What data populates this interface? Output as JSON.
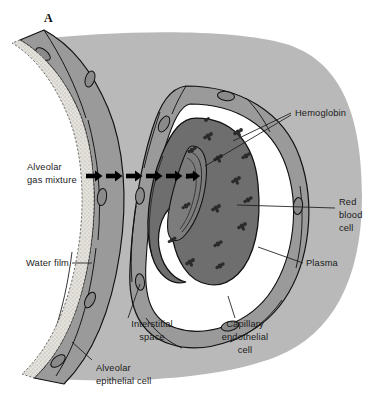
{
  "figure": {
    "panel_label": "A",
    "background_color": "#ffffff"
  },
  "palette": {
    "interstitial_gray": "#b9b9b9",
    "epithelium_gray": "#9a9a9a",
    "endothelium_gray": "#9a9a9a",
    "plasma_white": "#ffffff",
    "rbc_gray": "#6e6e6e",
    "rbc_inner_gray": "#7c7c7c",
    "hemoglobin_dark": "#2b2b2b",
    "water_film_light": "#e2e0da",
    "nucleus_gray": "#8a8a8a",
    "outline_black": "#111111",
    "arrow_black": "#000000"
  },
  "labels": {
    "hemoglobin": {
      "text": "Hemoglobin",
      "lines": [
        "Hemoglobin"
      ],
      "align": "left"
    },
    "alveolar_gas_mixture": {
      "text": "Alveolar gas mixture",
      "lines": [
        "Alveolar",
        "gas mixture"
      ],
      "align": "left"
    },
    "red_blood_cell": {
      "text": "Red blood cell",
      "lines": [
        "Red",
        "blood",
        "cell"
      ],
      "align": "left"
    },
    "water_film": {
      "text": "Water film",
      "lines": [
        "Water film"
      ],
      "align": "right"
    },
    "plasma": {
      "text": "Plasma",
      "lines": [
        "Plasma"
      ],
      "align": "left"
    },
    "interstitial_space": {
      "text": "Interstitial space",
      "lines": [
        "Interstitial",
        "space"
      ],
      "align": "center"
    },
    "capillary_endothelial_cell": {
      "text": "Capillary endothelial cell",
      "lines": [
        "Capillary",
        "endothelial",
        "cell"
      ],
      "align": "center"
    },
    "alveolar_epithelial_cell": {
      "text": "Alveolar epithelial cell",
      "lines": [
        "Alveolar",
        "epithelial cell"
      ],
      "align": "left"
    }
  },
  "diagram": {
    "type": "biological-cross-section",
    "gas_diffusion_arrows": {
      "count": 6,
      "direction": "left-to-right",
      "y": 176
    },
    "structures_outward_to_inward": [
      "alveolar gas mixture",
      "water film",
      "alveolar epithelial cell",
      "interstitial space",
      "capillary endothelial cell",
      "plasma",
      "red blood cell",
      "hemoglobin"
    ],
    "hemoglobin_molecule_count": 16,
    "epithelial_nuclei_count": 4,
    "endothelial_nuclei_count": 5
  }
}
